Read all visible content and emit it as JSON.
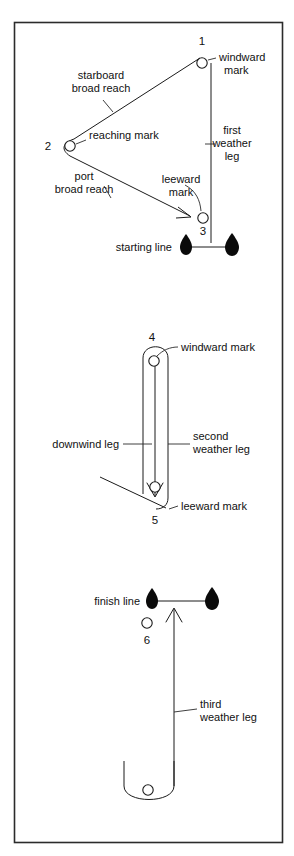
{
  "figure": {
    "background_color": "#ffffff",
    "line_color": "#1a1a1a",
    "boat_color": "#0a0a0a",
    "frame_color": "#2b2b2b"
  },
  "panels": [
    {
      "id": "panel-first-round",
      "labels": {
        "mark_1_number": "1",
        "mark_1_name": "windward\nmark",
        "mark_1_name_line1": "windward",
        "mark_1_name_line2": "mark",
        "mark_2_number": "2",
        "mark_2_name": "reaching mark",
        "mark_3_number": "3",
        "mark_3_name_line1": "leeward",
        "mark_3_name_line2": "mark",
        "leg_starboard_line1": "starboard",
        "leg_starboard_line2": "broad reach",
        "leg_port_line1": "port",
        "leg_port_line2": "broad reach",
        "leg_first_weather_line1": "first",
        "leg_first_weather_line2": "weather",
        "leg_first_weather_line3": "leg",
        "starting_line": "starting line"
      }
    },
    {
      "id": "panel-second-round",
      "labels": {
        "mark_4_number": "4",
        "mark_4_name": "windward mark",
        "mark_5_number": "5",
        "mark_5_name": "leeward mark",
        "leg_downwind": "downwind leg",
        "leg_second_weather_line1": "second",
        "leg_second_weather_line2": "weather leg"
      }
    },
    {
      "id": "panel-finish",
      "labels": {
        "finish_line": "finish line",
        "mark_6_number": "6",
        "leg_third_weather_line1": "third",
        "leg_third_weather_line2": "weather leg"
      }
    }
  ],
  "marks": [
    {
      "number": "1",
      "name": "windward mark",
      "cx": 202,
      "cy": 63
    },
    {
      "number": "2",
      "name": "reaching mark",
      "cx": 70,
      "cy": 146
    },
    {
      "number": "3",
      "name": "leeward mark",
      "cx": 203,
      "cy": 218
    },
    {
      "number": "4",
      "name": "windward mark",
      "cx": 154,
      "cy": 361
    },
    {
      "number": "5",
      "name": "leeward mark",
      "cx": 155,
      "cy": 487
    },
    {
      "number": "6",
      "name": "finish mark",
      "cx": 147,
      "cy": 623
    },
    {
      "number": "",
      "name": "lower turning mark",
      "cx": 148,
      "cy": 790
    }
  ],
  "legs": [
    {
      "name": "first weather leg",
      "label": "first weather leg"
    },
    {
      "name": "starboard broad reach",
      "label": "starboard broad reach"
    },
    {
      "name": "port broad reach",
      "label": "port broad reach"
    },
    {
      "name": "downwind leg",
      "label": "downwind leg"
    },
    {
      "name": "second weather leg",
      "label": "second weather leg"
    },
    {
      "name": "third weather leg",
      "label": "third weather leg"
    }
  ]
}
